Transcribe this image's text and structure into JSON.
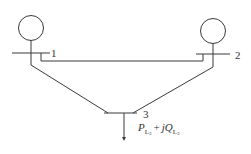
{
  "diagram": {
    "type": "three-bus power system one-line diagram",
    "buses": [
      {
        "id": 1,
        "label": "1",
        "has_generator": true
      },
      {
        "id": 2,
        "label": "2",
        "has_generator": true
      },
      {
        "id": 3,
        "label": "3",
        "has_generator": false,
        "has_load": true
      }
    ],
    "lines": [
      {
        "from": 1,
        "to": 2
      },
      {
        "from": 1,
        "to": 3
      },
      {
        "from": 2,
        "to": 3
      }
    ],
    "load": {
      "bus": 3,
      "P": "P",
      "P_sub": "L",
      "P_subsub": "3",
      "plus": "+",
      "jQ": "jQ",
      "Q_sub": "L",
      "Q_subsub": "3"
    },
    "colors": {
      "stroke": "#3a3a3a",
      "background": "#ffffff"
    }
  }
}
